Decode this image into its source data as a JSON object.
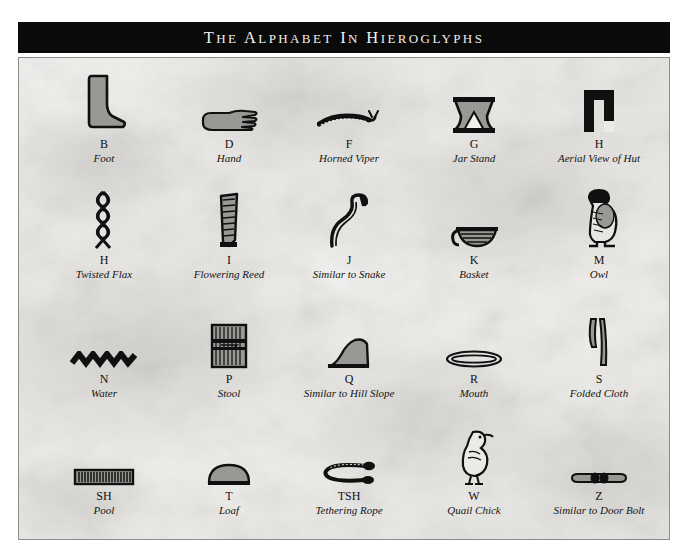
{
  "poster": {
    "title": "The Alphabet In Hieroglyphs",
    "background_color": "#eceae6",
    "title_bar_color": "#0a0a0a",
    "title_text_color": "#f2f0ec"
  },
  "rows": [
    {
      "cells": [
        {
          "letter": "B",
          "description": "Foot",
          "glyph": "foot-glyph"
        },
        {
          "letter": "D",
          "description": "Hand",
          "glyph": "hand-glyph"
        },
        {
          "letter": "F",
          "description": "Horned Viper",
          "glyph": "horned-viper-glyph"
        },
        {
          "letter": "G",
          "description": "Jar Stand",
          "glyph": "jar-stand-glyph"
        },
        {
          "letter": "H",
          "description": "Aerial View of Hut",
          "glyph": "hut-glyph"
        }
      ]
    },
    {
      "cells": [
        {
          "letter": "H",
          "description": "Twisted Flax",
          "glyph": "twisted-flax-glyph"
        },
        {
          "letter": "I",
          "description": "Flowering Reed",
          "glyph": "flowering-reed-glyph"
        },
        {
          "letter": "J",
          "description": "Similar to Snake",
          "glyph": "snake-glyph"
        },
        {
          "letter": "K",
          "description": "Basket",
          "glyph": "basket-glyph"
        },
        {
          "letter": "M",
          "description": "Owl",
          "glyph": "owl-glyph"
        }
      ]
    },
    {
      "cells": [
        {
          "letter": "N",
          "description": "Water",
          "glyph": "water-glyph"
        },
        {
          "letter": "P",
          "description": "Stool",
          "glyph": "stool-glyph"
        },
        {
          "letter": "Q",
          "description": "Similar to Hill Slope",
          "glyph": "hill-slope-glyph"
        },
        {
          "letter": "R",
          "description": "Mouth",
          "glyph": "mouth-glyph"
        },
        {
          "letter": "S",
          "description": "Folded Cloth",
          "glyph": "folded-cloth-glyph"
        }
      ]
    },
    {
      "cells": [
        {
          "letter": "SH",
          "description": "Pool",
          "glyph": "pool-glyph"
        },
        {
          "letter": "T",
          "description": "Loaf",
          "glyph": "loaf-glyph"
        },
        {
          "letter": "TSH",
          "description": "Tethering Rope",
          "glyph": "tethering-rope-glyph"
        },
        {
          "letter": "W",
          "description": "Quail Chick",
          "glyph": "quail-chick-glyph"
        },
        {
          "letter": "Z",
          "description": "Similar to Door Bolt",
          "glyph": "door-bolt-glyph"
        }
      ]
    }
  ]
}
